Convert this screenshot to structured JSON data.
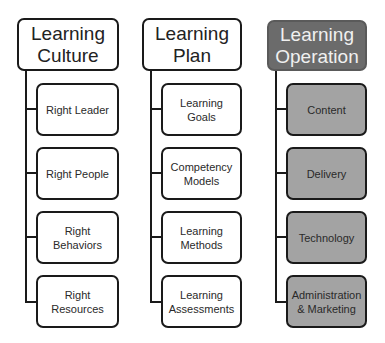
{
  "columns": [
    {
      "title_line1": "Learning",
      "title_line2": "Culture",
      "style": "light",
      "items": [
        {
          "line1": "Right Leader",
          "line2": ""
        },
        {
          "line1": "Right People",
          "line2": ""
        },
        {
          "line1": "Right",
          "line2": "Behaviors"
        },
        {
          "line1": "Right",
          "line2": "Resources"
        }
      ]
    },
    {
      "title_line1": "Learning",
      "title_line2": "Plan",
      "style": "light",
      "items": [
        {
          "line1": "Learning Goals",
          "line2": ""
        },
        {
          "line1": "Competency",
          "line2": "Models"
        },
        {
          "line1": "Learning",
          "line2": "Methods"
        },
        {
          "line1": "Learning",
          "line2": "Assessments"
        }
      ]
    },
    {
      "title_line1": "Learning",
      "title_line2": "Operation",
      "style": "dark",
      "items": [
        {
          "line1": "Content",
          "line2": ""
        },
        {
          "line1": "Delivery",
          "line2": ""
        },
        {
          "line1": "Technology",
          "line2": ""
        },
        {
          "line1": "Administration",
          "line2": "& Marketing"
        }
      ]
    }
  ],
  "colors": {
    "header_dark": "#6b6b6b",
    "child_gray": "#a3a3a3",
    "border": "#1a1a1a"
  }
}
